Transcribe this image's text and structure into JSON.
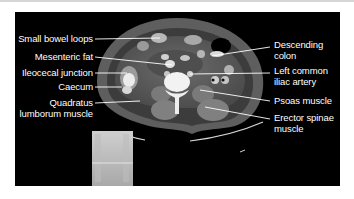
{
  "figure": {
    "type": "axial CT abdomen at level of iliac crest with scout localizer",
    "background": "#000000",
    "left_labels": [
      {
        "text": "Small bowel loops"
      },
      {
        "text": "Mesenteric fat"
      },
      {
        "text": "Ileocecal junction"
      },
      {
        "text": "Caecum"
      },
      {
        "line1": "Quadratus",
        "line2": "lumborum muscle"
      }
    ],
    "right_labels": [
      {
        "line1": "Descending",
        "line2": "colon"
      },
      {
        "line1": "Left common",
        "line2": "iliac artery"
      },
      {
        "text": "Psoas muscle"
      },
      {
        "line1": "Erector spinae",
        "line2": "muscle"
      }
    ],
    "scout": {
      "description": "scout localizer with slice line"
    }
  }
}
